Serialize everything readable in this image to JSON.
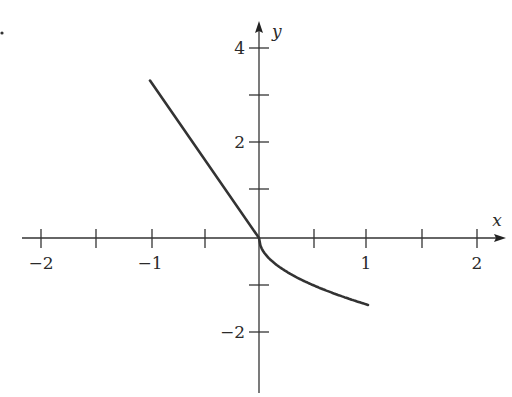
{
  "chart_data": {
    "type": "line",
    "title": "",
    "xlabel": "x",
    "ylabel": "y",
    "xlim": [
      -2,
      2
    ],
    "ylim": [
      -2.9,
      4.6
    ],
    "x_ticks": [
      -2,
      -1.5,
      -1,
      -0.5,
      0.5,
      1,
      1.5,
      2
    ],
    "x_tick_labels": [
      {
        "value": -2,
        "label": "−2"
      },
      {
        "value": -1,
        "label": "−1"
      },
      {
        "value": 1,
        "label": "1"
      },
      {
        "value": 2,
        "label": "2"
      }
    ],
    "y_ticks": [
      -2,
      -1,
      1,
      2,
      3,
      4
    ],
    "y_tick_labels": [
      {
        "value": 4,
        "label": "4"
      },
      {
        "value": 2,
        "label": "2"
      },
      {
        "value": -2,
        "label": "−2"
      }
    ],
    "grid": false,
    "legend": null,
    "series": [
      {
        "name": "f(x)",
        "x": [
          -2,
          -1.5,
          -1,
          -0.5,
          0,
          0.05,
          0.1,
          0.25,
          0.5,
          0.75,
          1,
          1.25,
          1.5,
          1.75,
          2
        ],
        "values": [
          3.33,
          2.5,
          1.67,
          0.83,
          0,
          -0.22,
          -0.32,
          -0.5,
          -0.71,
          -0.87,
          -1.0,
          -1.12,
          -1.22,
          -1.32,
          -1.41
        ]
      }
    ]
  },
  "labels": {
    "x_axis": "x",
    "y_axis": "y",
    "x_m2": "−2",
    "x_m1": "−1",
    "x_1": "1",
    "x_2": "2",
    "y_4": "4",
    "y_2": "2",
    "y_m2": "−2"
  }
}
